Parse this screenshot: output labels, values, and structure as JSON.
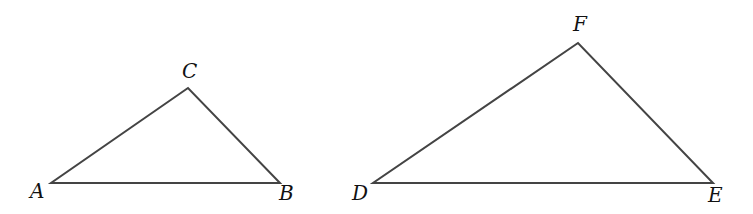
{
  "diagram": {
    "type": "geometry",
    "triangles": [
      {
        "name": "ABC",
        "vertices": [
          {
            "label": "A",
            "x": 51,
            "y": 183,
            "lx": 30,
            "ly": 198
          },
          {
            "label": "B",
            "x": 280,
            "y": 183,
            "lx": 279,
            "ly": 200
          },
          {
            "label": "C",
            "x": 188,
            "y": 88,
            "lx": 182,
            "ly": 78
          }
        ]
      },
      {
        "name": "DEF",
        "vertices": [
          {
            "label": "D",
            "x": 373,
            "y": 183,
            "lx": 352,
            "ly": 200
          },
          {
            "label": "E",
            "x": 713,
            "y": 183,
            "lx": 708,
            "ly": 202
          },
          {
            "label": "F",
            "x": 578,
            "y": 43,
            "lx": 573,
            "ly": 31
          }
        ]
      }
    ],
    "colors": {
      "line": "#444444",
      "text": "#111111",
      "background": "#ffffff"
    }
  }
}
